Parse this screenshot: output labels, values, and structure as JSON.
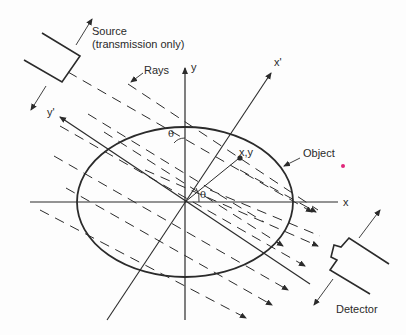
{
  "diagram": {
    "labels": {
      "source": "Source",
      "source_note": "(transmission only)",
      "rays": "Rays",
      "y_axis": "y",
      "x_axis": "x",
      "x_prime": "x'",
      "y_prime": "y'",
      "theta_top": "θ",
      "theta_origin": "θ",
      "point": "x,y",
      "object": "Object",
      "detector": "Detector"
    },
    "colors": {
      "line": "#2b2b2b",
      "accent_mark": "#e0287a"
    }
  }
}
